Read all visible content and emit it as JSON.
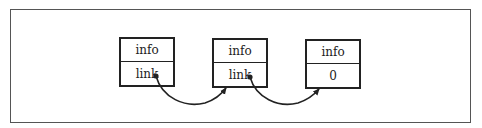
{
  "diagram": {
    "type": "linked-list",
    "nodes": [
      {
        "info": "info",
        "link": "link"
      },
      {
        "info": "info",
        "link": "link"
      },
      {
        "info": "info",
        "link": "0"
      }
    ],
    "edges": [
      {
        "from": 0,
        "to": 1,
        "style": "curved-arrow"
      },
      {
        "from": 1,
        "to": 2,
        "style": "curved-arrow"
      }
    ]
  },
  "colors": {
    "stroke": "#222222",
    "frame": "#555555",
    "background": "#ffffff"
  }
}
